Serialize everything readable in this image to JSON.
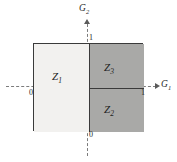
{
  "figure": {
    "type": "region-partition-diagram",
    "axes": {
      "x_name": "G",
      "x_sub": "1",
      "y_name": "G",
      "y_sub": "2"
    },
    "ticks": {
      "x_origin": "0",
      "x_max": "1",
      "y_max": "1",
      "y_origin": "0"
    },
    "regions": [
      {
        "name": "Z",
        "sub": "1",
        "position": "left-half",
        "fill": "#f2f1ef"
      },
      {
        "name": "Z",
        "sub": "3",
        "position": "upper-right-quad",
        "fill": "#a9a9a7"
      },
      {
        "name": "Z",
        "sub": "2",
        "position": "lower-right-quad",
        "fill": "#a9a9a7"
      }
    ],
    "colors": {
      "light_fill": "#f2f1ef",
      "dark_fill": "#a9a9a7",
      "outline": "#3a3a3a",
      "axis_line": "#7c7c7c",
      "background": "#ffffff"
    }
  },
  "chart_data": {
    "type": "diagram",
    "title": "",
    "xlabel": "G1",
    "ylabel": "G2",
    "xlim": [
      0,
      1
    ],
    "ylim": [
      0,
      1
    ],
    "xticks": [
      "0",
      "1"
    ],
    "yticks": [
      "0",
      "1"
    ],
    "grid": false,
    "legend": "none",
    "regions": [
      {
        "label": "Z1",
        "x_range": [
          0.0,
          0.5
        ],
        "y_range": [
          0.0,
          1.0
        ],
        "shade": "light"
      },
      {
        "label": "Z3",
        "x_range": [
          0.5,
          1.0
        ],
        "y_range": [
          0.5,
          1.0
        ],
        "shade": "dark"
      },
      {
        "label": "Z2",
        "x_range": [
          0.5,
          1.0
        ],
        "y_range": [
          0.0,
          0.5
        ],
        "shade": "dark"
      }
    ]
  }
}
